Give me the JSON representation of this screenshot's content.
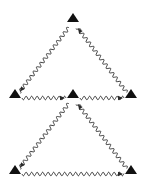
{
  "diagram": {
    "type": "feynman-style wavy-edge triangle network",
    "colors": {
      "stroke": "#2a2a2a",
      "vertex": "#111111",
      "background": "#ffffff"
    },
    "vertices": [
      {
        "id": "top",
        "x": 73,
        "y": 22
      },
      {
        "id": "mid_left",
        "x": 15,
        "y": 98
      },
      {
        "id": "mid_center",
        "x": 73,
        "y": 98
      },
      {
        "id": "mid_right",
        "x": 131,
        "y": 98
      },
      {
        "id": "bot_left",
        "x": 15,
        "y": 174
      },
      {
        "id": "bot_right",
        "x": 131,
        "y": 174
      }
    ],
    "edges": [
      {
        "from": "top",
        "to": "mid_left",
        "arrow_at": "mid_left"
      },
      {
        "from": "mid_right",
        "to": "top",
        "arrow_at": "top"
      },
      {
        "from": "mid_left",
        "to": "mid_center",
        "arrow_at": "mid_center"
      },
      {
        "from": "mid_center",
        "to": "mid_right",
        "arrow_at": "mid_right"
      },
      {
        "from": "mid_center",
        "to": "bot_left",
        "arrow_at": "bot_left"
      },
      {
        "from": "bot_right",
        "to": "mid_center",
        "arrow_at": "mid_center"
      },
      {
        "from": "bot_left",
        "to": "bot_right",
        "arrow_at": "bot_right"
      }
    ]
  }
}
